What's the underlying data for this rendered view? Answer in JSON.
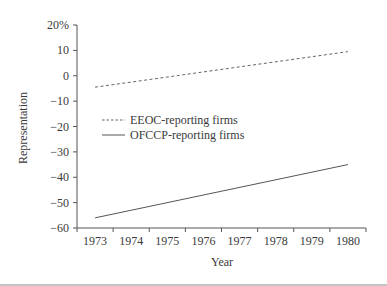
{
  "chart_data": {
    "type": "line",
    "title": "",
    "xlabel": "Year",
    "ylabel": "Representation",
    "x": [
      1973,
      1980
    ],
    "x_ticks": [
      "1973",
      "1974",
      "1975",
      "1976",
      "1977",
      "1978",
      "1979",
      "1980"
    ],
    "y_ticks": [
      20,
      10,
      0,
      -10,
      -20,
      -30,
      -40,
      -50,
      -60
    ],
    "y_tick_labels": [
      "20%",
      "10",
      "0",
      "−10",
      "−20",
      "−30",
      "−40",
      "−50",
      "−60"
    ],
    "ylim": [
      -60,
      20
    ],
    "grid": false,
    "legend_position": "middle-left",
    "series": [
      {
        "name": "EEOC-reporting firms",
        "style": "dashed",
        "values": [
          -4.5,
          9.5
        ]
      },
      {
        "name": "OFCCP-reporting firms",
        "style": "solid",
        "values": [
          -56,
          -35
        ]
      }
    ]
  }
}
